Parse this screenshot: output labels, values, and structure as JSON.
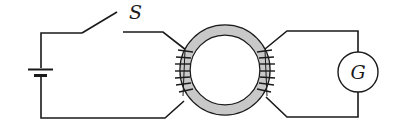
{
  "diagram": {
    "title": "",
    "labels": {
      "switch": "S",
      "galvanometer": "G"
    },
    "components": [
      {
        "type": "battery",
        "name": "battery"
      },
      {
        "type": "switch",
        "name": "switch",
        "label": "S",
        "state": "open"
      },
      {
        "type": "toroid",
        "name": "iron-ring",
        "windings": [
          "primary-coil-left",
          "secondary-coil-right"
        ]
      },
      {
        "type": "galvanometer",
        "name": "galvanometer",
        "label": "G"
      }
    ],
    "colors": {
      "wire": "#1a1a1a",
      "ring_fill": "#c8c8c8",
      "background": "#ffffff"
    }
  }
}
